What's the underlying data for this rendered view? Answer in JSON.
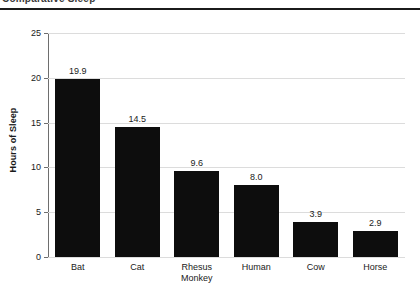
{
  "header": {
    "title_fragment": "Comparative Sleep",
    "rule_color": "#1b1b1b"
  },
  "chart_data": {
    "type": "bar",
    "title": "",
    "xlabel": "",
    "ylabel": "Hours of Sleep",
    "categories": [
      "Bat",
      "Cat",
      "Rhesus\nMonkey",
      "Human",
      "Cow",
      "Horse"
    ],
    "values": [
      19.9,
      14.5,
      9.6,
      8.0,
      3.9,
      2.9
    ],
    "value_labels": [
      "19.9",
      "14.5",
      "9.6",
      "8.0",
      "3.9",
      "2.9"
    ],
    "ylim": [
      0,
      25
    ],
    "yticks": [
      0,
      5,
      10,
      15,
      20,
      25
    ],
    "ytick_labels": [
      "0",
      "5",
      "10",
      "15",
      "20",
      "25"
    ],
    "grid": true,
    "legend": "none",
    "bar_color": "#0d0d0d",
    "grid_color": "#dcdcdc",
    "axis_color": "#6e6e6e"
  }
}
